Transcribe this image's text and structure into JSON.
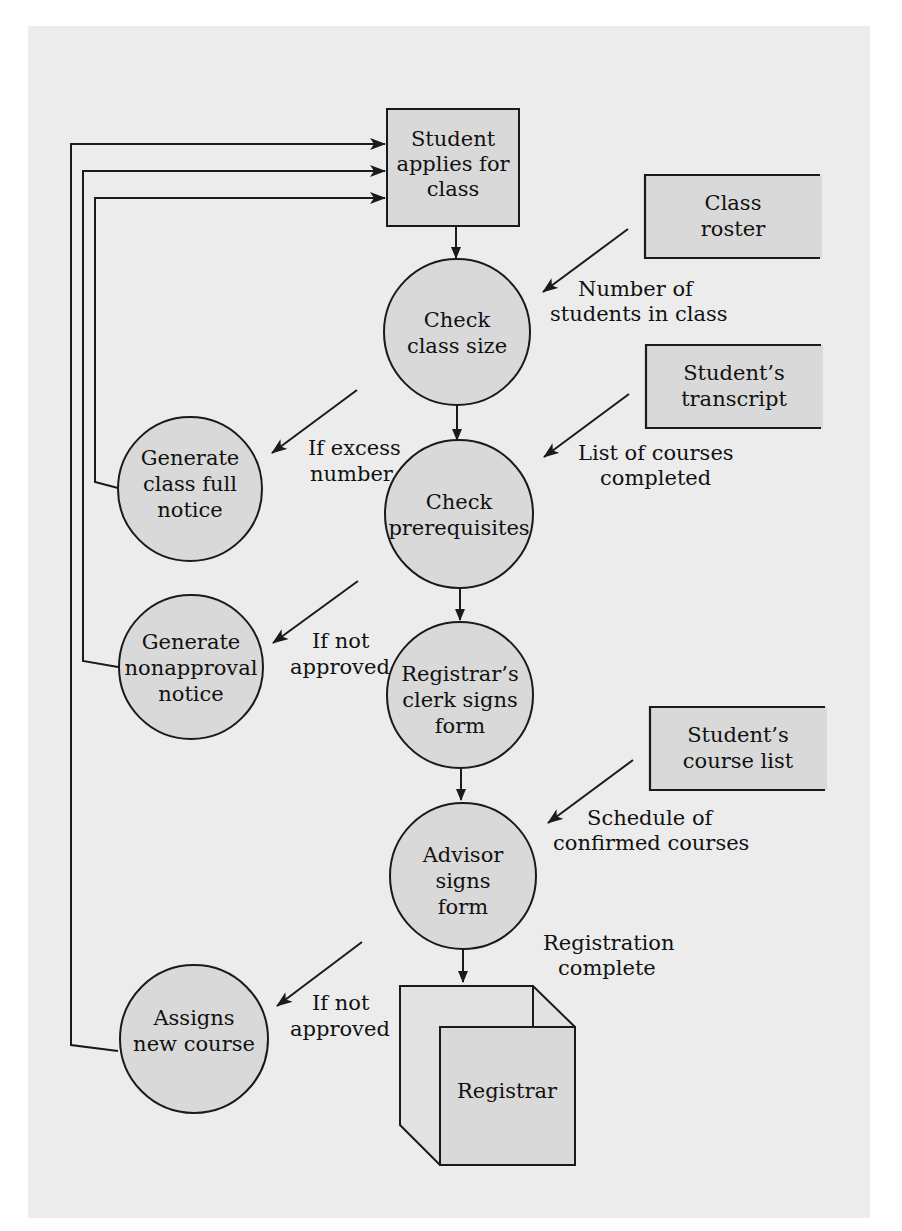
{
  "diagram": {
    "type": "data-flow-diagram",
    "colors": {
      "paper": "#ececec",
      "shape_fill": "#d9d9d9",
      "stroke": "#1a1a1a"
    },
    "external_entity": {
      "lines": [
        "Student",
        "applies for",
        "class"
      ]
    },
    "processes": {
      "check_class_size": {
        "lines": [
          "Check",
          "class size"
        ]
      },
      "check_prerequisites": {
        "lines": [
          "Check",
          "prerequisites"
        ]
      },
      "clerk_signs": {
        "lines": [
          "Registrar’s",
          "clerk signs",
          "form"
        ]
      },
      "advisor_signs": {
        "lines": [
          "Advisor",
          "signs",
          "form"
        ]
      },
      "class_full_notice": {
        "lines": [
          "Generate",
          "class full",
          "notice"
        ]
      },
      "nonapproval_notice": {
        "lines": [
          "Generate",
          "nonapproval",
          "notice"
        ]
      },
      "assigns_new_course": {
        "lines": [
          "Assigns",
          "new course"
        ]
      }
    },
    "data_stores": {
      "class_roster": {
        "lines": [
          "Class",
          "roster"
        ]
      },
      "student_transcript": {
        "lines": [
          "Student’s",
          "transcript"
        ]
      },
      "student_course_list": {
        "lines": [
          "Student’s",
          "course list"
        ]
      }
    },
    "flow_labels": {
      "number_of_students": [
        "Number of",
        "students in class"
      ],
      "list_of_courses": [
        "List of courses",
        "completed"
      ],
      "schedule": [
        "Schedule of",
        "confirmed courses"
      ],
      "if_excess": [
        "If excess",
        "number"
      ],
      "if_not_approved_1": [
        "If not",
        "approved"
      ],
      "if_not_approved_2": [
        "If not",
        "approved"
      ],
      "registration_complete": [
        "Registration",
        "complete"
      ]
    },
    "registrar": {
      "label": "Registrar"
    }
  }
}
